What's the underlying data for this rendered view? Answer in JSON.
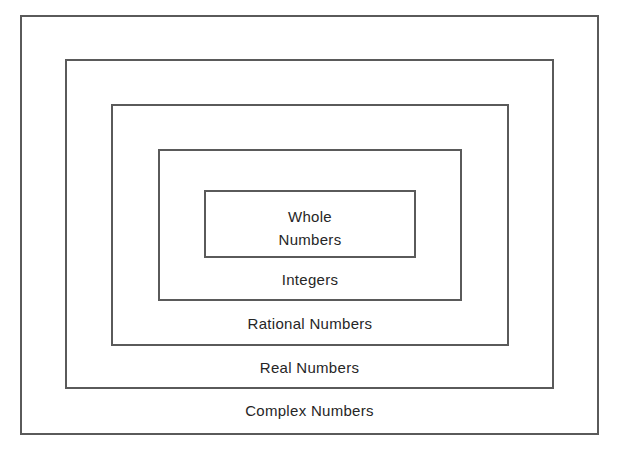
{
  "diagram": {
    "type": "nested-sets",
    "title": "",
    "colors": {
      "line": "#5a5a5a",
      "text": "#262626",
      "background": "#ffffff"
    },
    "sets": [
      {
        "name": "complex",
        "label": "Complex Numbers"
      },
      {
        "name": "real",
        "label": "Real Numbers"
      },
      {
        "name": "rational",
        "label": "Rational Numbers"
      },
      {
        "name": "integers",
        "label": "Integers"
      },
      {
        "name": "whole",
        "label_line1": "Whole",
        "label_line2": "Numbers"
      }
    ]
  }
}
